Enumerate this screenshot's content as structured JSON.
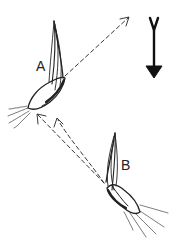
{
  "figure": {
    "labels": {
      "a": "A",
      "b": "B"
    },
    "elements": [
      {
        "id": "organism-a",
        "label": "A",
        "description": "elongated curved body with tapered tip pointing up; jet streams emitted from lower-left end"
      },
      {
        "id": "organism-b",
        "label": "B",
        "description": "elongated curved body with tapered tip pointing up; jet streams emitted from lower-right end"
      },
      {
        "id": "dashed-trajectory-a",
        "description": "dashed arrow from A toward upper right"
      },
      {
        "id": "dashed-trajectories-b",
        "description": "two dashed arrows from B toward A"
      },
      {
        "id": "gravity-arrow",
        "description": "solid downward arrow with forked top at upper right"
      }
    ],
    "colors": {
      "ink": "#222222",
      "background": "#ffffff"
    }
  }
}
